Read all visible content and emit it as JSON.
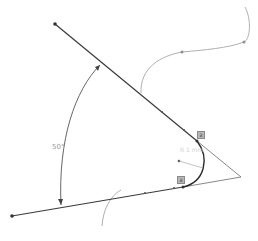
{
  "sketch": {
    "angle_dimension": {
      "label": "50°"
    },
    "radius_dimension": {
      "label": "R 1 mm"
    },
    "constraints": [
      {
        "type": "tangent",
        "symbol": "ƨ"
      },
      {
        "type": "tangent",
        "symbol": "ƨ"
      }
    ],
    "colors": {
      "line": "#3a3a3a",
      "construction": "#a8a8a8",
      "dimension": "#555555",
      "label": "#9a9a9a"
    }
  }
}
